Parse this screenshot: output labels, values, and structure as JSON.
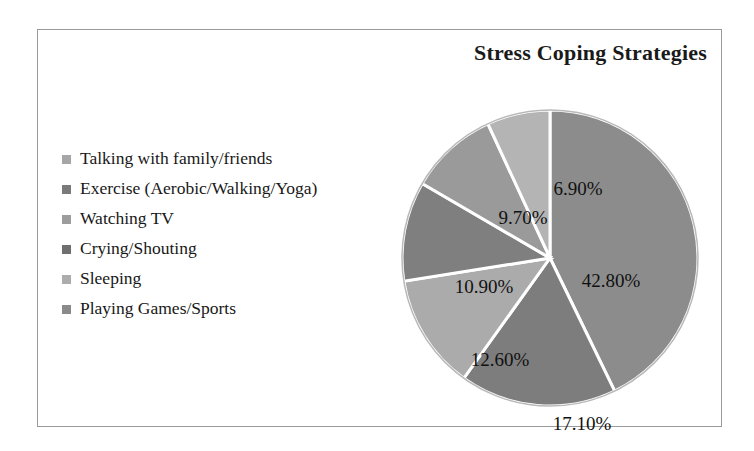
{
  "chart": {
    "title": "Stress Coping Strategies",
    "border_color": "#9a9a9a",
    "background": "#ffffff"
  },
  "legend": {
    "items": [
      {
        "label": "Talking with family/friends",
        "swatch_name": "legend-swatch-talking",
        "color": "#a6a6a6"
      },
      {
        "label": "Exercise (Aerobic/Walking/Yoga)",
        "swatch_name": "legend-swatch-exercise",
        "color": "#7a7a7a"
      },
      {
        "label": "Watching TV",
        "swatch_name": "legend-swatch-tv",
        "color": "#9c9c9c"
      },
      {
        "label": "Crying/Shouting",
        "swatch_name": "legend-swatch-crying",
        "color": "#6f6f6f"
      },
      {
        "label": "Sleeping",
        "swatch_name": "legend-swatch-sleeping",
        "color": "#acacac"
      },
      {
        "label": "Playing Games/Sports",
        "swatch_name": "legend-swatch-games",
        "color": "#8a8a8a"
      }
    ]
  },
  "chart_data": {
    "type": "pie",
    "title": "Stress Coping Strategies",
    "xlabel": "",
    "ylabel": "",
    "legend_position": "left",
    "grid": false,
    "start_angle_deg": 0,
    "direction": "clockwise",
    "categories": [
      "Talking with family/friends",
      "Exercise (Aerobic/Walking/Yoga)",
      "Watching TV",
      "Crying/Shouting",
      "Sleeping",
      "Playing Games/Sports"
    ],
    "values": [
      42.8,
      17.1,
      12.6,
      10.9,
      9.7,
      6.9
    ],
    "data_labels": [
      "42.80%",
      "17.10%",
      "12.60%",
      "10.90%",
      "9.70%",
      "6.90%"
    ],
    "colors": [
      "#8c8c8c",
      "#7d7d7d",
      "#ababab",
      "#7f7f7f",
      "#9a9a9a",
      "#b4b4b4"
    ],
    "slice_separator_color": "#ffffff",
    "units": "percent",
    "total": 100.0
  },
  "slice_labels": [
    {
      "text": "42.80%",
      "name": "slice-label-talking",
      "x": 211,
      "y": 173
    },
    {
      "text": "17.10%",
      "name": "slice-label-exercise",
      "x": 182,
      "y": 316
    },
    {
      "text": "12.60%",
      "name": "slice-label-tv",
      "x": 100,
      "y": 252
    },
    {
      "text": "10.90%",
      "name": "slice-label-crying",
      "x": 84,
      "y": 179
    },
    {
      "text": "9.70%",
      "name": "slice-label-sleeping",
      "x": 123,
      "y": 110
    },
    {
      "text": "6.90%",
      "name": "slice-label-games",
      "x": 178,
      "y": 81
    }
  ]
}
